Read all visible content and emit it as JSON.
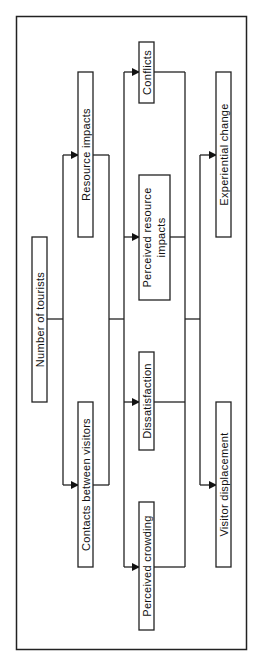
{
  "diagram": {
    "nodes": [
      {
        "id": "number_of_tourists",
        "label": "Number of tourists"
      },
      {
        "id": "resource_impacts",
        "label": "Resource impacts"
      },
      {
        "id": "contacts_between_visitors",
        "label": "Contacts between visitors"
      },
      {
        "id": "conflicts",
        "label": "Conflicts"
      },
      {
        "id": "perceived_resource_impacts",
        "label": [
          "Perceived resource",
          "impacts"
        ]
      },
      {
        "id": "dissatisfaction",
        "label": "Dissatisfaction"
      },
      {
        "id": "perceived_crowding",
        "label": "Perceived crowding"
      },
      {
        "id": "experiential_change",
        "label": "Experiential change"
      },
      {
        "id": "visitor_displacement",
        "label": "Visitor displacement"
      }
    ],
    "labels": {
      "n1": "Number of tourists",
      "n2": "Resource impacts",
      "n3": "Contacts between visitors",
      "n4": "Conflicts",
      "n5a": "Perceived resource",
      "n5b": "impacts",
      "n6": "Dissatisfaction",
      "n7": "Perceived crowding",
      "n8": "Experiential change",
      "n9": "Visitor displacement"
    },
    "edges": [
      {
        "from": "number_of_tourists",
        "to": "resource_impacts"
      },
      {
        "from": "number_of_tourists",
        "to": "contacts_between_visitors"
      },
      {
        "from": "resource_impacts",
        "to": "perceived_resource_impacts"
      },
      {
        "from": "contacts_between_visitors",
        "to": "conflicts"
      },
      {
        "from": "contacts_between_visitors",
        "to": "dissatisfaction"
      },
      {
        "from": "contacts_between_visitors",
        "to": "perceived_crowding"
      },
      {
        "from": "perceived_crowding",
        "to": "experiential_change"
      },
      {
        "from": "perceived_crowding",
        "to": "visitor_displacement"
      }
    ],
    "orientation": "rotated 90deg counter-clockwise"
  }
}
